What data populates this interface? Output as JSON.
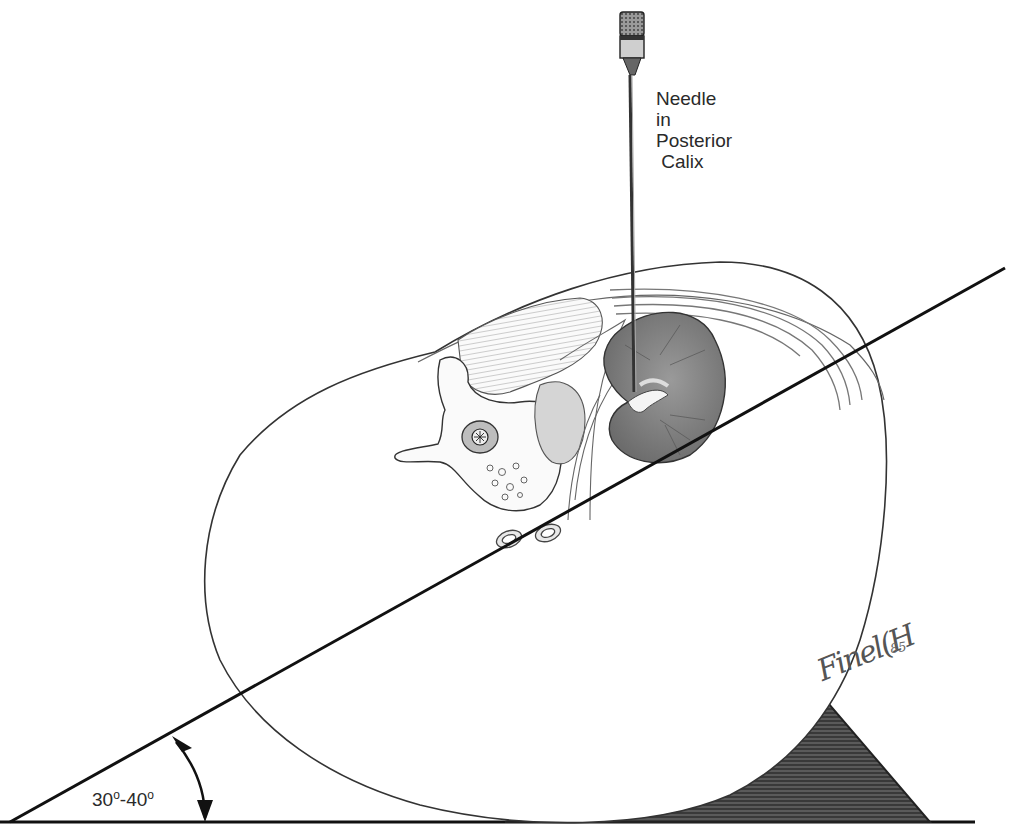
{
  "figure": {
    "type": "medical-illustration"
  },
  "labels": {
    "needle": [
      "Needle",
      "in",
      "Posterior",
      " Calix"
    ],
    "angle_from": "30",
    "angle_to": "40",
    "angle_sep": "-",
    "angle_unit": "o",
    "signature": "Finel(H",
    "signature_year": "85"
  },
  "colors": {
    "line": "#111111",
    "pencil": "#555555",
    "kidney": "#7a7a7a",
    "wedge": "#3c3c3c",
    "background": "#ffffff"
  },
  "geometry": {
    "table_y": 822,
    "tilt_line": {
      "x1": 10,
      "y1": 822,
      "x2": 1005,
      "y2": 268
    },
    "needle_x": 634,
    "needle_top": 12,
    "needle_tip_y": 392
  }
}
